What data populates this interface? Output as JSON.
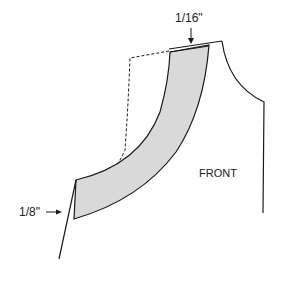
{
  "diagram": {
    "panel_label": "FRONT",
    "measure_top": "1/16\"",
    "measure_left": "1/8\"",
    "colors": {
      "line": "#1a1a1a",
      "band_fill": "#d9d9d9",
      "background": "#ffffff"
    }
  }
}
